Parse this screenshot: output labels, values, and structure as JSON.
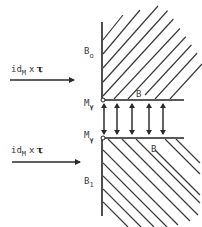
{
  "diagram": {
    "type": "physics-schematic",
    "colors": {
      "ink": "#2a2a2a",
      "label": "#3a3a3a",
      "background": "#ffffff"
    },
    "upper_region": {
      "boundary_label": "B",
      "boundary_subscript": "o",
      "edge_label": "B",
      "corner_point_label": "M",
      "corner_point_subscript": "γ"
    },
    "lower_region": {
      "boundary_label": "B",
      "boundary_subscript": "1",
      "edge_label": "B",
      "corner_point_label": "M",
      "corner_point_subscript": "γ"
    },
    "arrows": [
      {
        "label_prefix": "id",
        "label_subscript": "M",
        "label_times": "x",
        "label_symbol": "τ"
      },
      {
        "label_prefix": "id",
        "label_subscript": "M",
        "label_times": "x",
        "label_symbol": "τ"
      }
    ],
    "double_arrows_count": 5
  }
}
